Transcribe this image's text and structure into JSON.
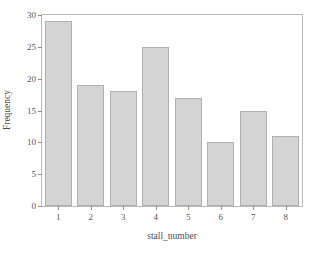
{
  "chart_data": {
    "type": "bar",
    "title": "",
    "xlabel": "stall_number",
    "ylabel": "Frequency",
    "categories": [
      "1",
      "2",
      "3",
      "4",
      "5",
      "6",
      "7",
      "8"
    ],
    "values": [
      29,
      19,
      18,
      25,
      17,
      10,
      15,
      11
    ],
    "series": [
      {
        "name": "Frequency",
        "values": [
          29,
          19,
          18,
          25,
          17,
          10,
          15,
          11
        ]
      }
    ],
    "ylim": [
      0,
      30
    ],
    "yticks": [
      0,
      5,
      10,
      15,
      20,
      25,
      30
    ],
    "ytick_labels": [
      "0",
      "5",
      "10",
      "15",
      "20",
      "25",
      "30"
    ],
    "xtick_labels": [
      "1",
      "2",
      "3",
      "4",
      "5",
      "6",
      "7",
      "8"
    ],
    "grid": false,
    "legend": "none",
    "bar_fill_color": "#d4d4d4",
    "bar_edge_color": "#b0b0b0",
    "frame_color": "#b9b9b9",
    "background_color": "#ffffff",
    "text_color": "#4d4d4d"
  }
}
